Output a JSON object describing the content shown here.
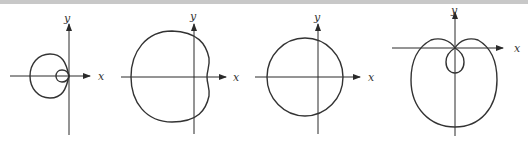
{
  "figure": {
    "panels": [
      {
        "id": "limacon-inner-loop-left",
        "x_label": "x",
        "y_label": "y"
      },
      {
        "id": "dimpled-limacon-left",
        "x_label": "x",
        "y_label": "y"
      },
      {
        "id": "circle-like-limacon",
        "x_label": "x",
        "y_label": "y"
      },
      {
        "id": "limacon-inner-loop-down",
        "x_label": "x",
        "y_label": "y"
      }
    ]
  }
}
